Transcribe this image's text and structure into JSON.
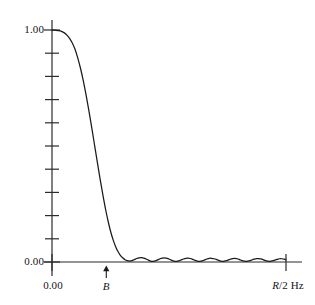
{
  "figure": {
    "name": "filter-frequency-response",
    "background_color": "#ffffff",
    "line_color": "#1a1a1a",
    "axis_color": "#2b2b2b"
  },
  "labels": {
    "y_top": "1.00",
    "y_bottom": "0.00",
    "x_origin": "0.00",
    "x_marker": "B",
    "x_right_italic": "R",
    "x_right_rest": "/2 Hz",
    "x_right_full": "R/2 Hz",
    "arrow_icon": "up-arrow-icon"
  },
  "chart_data": {
    "type": "line",
    "title": "",
    "xlabel": "R/2 Hz",
    "ylabel": "",
    "xlim": [
      0,
      1
    ],
    "ylim": [
      0,
      1.0
    ],
    "grid": false,
    "legend": null,
    "x_ticks": [
      {
        "value": 0,
        "label": "0.00"
      },
      {
        "value": 0.232,
        "label": "B"
      },
      {
        "value": 1.0,
        "label": "R/2 Hz"
      }
    ],
    "y_ticks": [
      {
        "value": 1.0,
        "label": "1.00"
      },
      {
        "value": 0.9,
        "label": ""
      },
      {
        "value": 0.8,
        "label": ""
      },
      {
        "value": 0.7,
        "label": ""
      },
      {
        "value": 0.6,
        "label": ""
      },
      {
        "value": 0.5,
        "label": ""
      },
      {
        "value": 0.4,
        "label": ""
      },
      {
        "value": 0.3,
        "label": ""
      },
      {
        "value": 0.2,
        "label": ""
      },
      {
        "value": 0.1,
        "label": ""
      },
      {
        "value": 0.0,
        "label": "0.00"
      }
    ],
    "annotations": [
      {
        "type": "arrow",
        "x": 0.232,
        "y": 0,
        "label": "B",
        "direction": "up"
      }
    ],
    "series": [
      {
        "name": "magnitude response",
        "x": [
          0.0,
          0.015,
          0.03,
          0.045,
          0.06,
          0.072,
          0.085,
          0.098,
          0.11,
          0.122,
          0.134,
          0.146,
          0.158,
          0.17,
          0.182,
          0.194,
          0.206,
          0.218,
          0.23,
          0.242,
          0.252,
          0.262,
          0.272,
          0.282,
          0.292,
          0.302,
          0.312,
          0.322,
          0.332,
          0.342,
          0.352,
          0.362,
          0.372,
          0.382,
          0.392,
          0.402,
          0.412,
          0.422,
          0.432,
          0.442,
          0.452,
          0.462,
          0.472,
          0.482,
          0.492,
          0.502,
          0.512,
          0.522,
          0.532,
          0.542,
          0.552,
          0.562,
          0.572,
          0.582,
          0.592,
          0.602,
          0.612,
          0.622,
          0.632,
          0.642,
          0.652,
          0.662,
          0.672,
          0.682,
          0.692,
          0.702,
          0.712,
          0.722,
          0.732,
          0.742,
          0.752,
          0.762,
          0.772,
          0.782,
          0.792,
          0.802,
          0.812,
          0.822,
          0.832,
          0.842,
          0.852,
          0.862,
          0.872,
          0.882,
          0.892,
          0.902,
          0.912,
          0.922,
          0.932,
          0.942,
          0.952,
          0.962,
          0.972,
          0.982,
          0.992,
          1.0
        ],
        "y": [
          1.0,
          0.999,
          0.997,
          0.992,
          0.982,
          0.968,
          0.947,
          0.918,
          0.88,
          0.834,
          0.78,
          0.718,
          0.65,
          0.578,
          0.503,
          0.428,
          0.355,
          0.286,
          0.222,
          0.166,
          0.126,
          0.093,
          0.066,
          0.045,
          0.029,
          0.018,
          0.01,
          0.006,
          0.004,
          0.006,
          0.01,
          0.015,
          0.018,
          0.019,
          0.017,
          0.013,
          0.008,
          0.004,
          0.003,
          0.005,
          0.009,
          0.014,
          0.017,
          0.018,
          0.016,
          0.012,
          0.007,
          0.004,
          0.003,
          0.005,
          0.009,
          0.013,
          0.016,
          0.017,
          0.015,
          0.011,
          0.007,
          0.004,
          0.003,
          0.005,
          0.009,
          0.013,
          0.016,
          0.016,
          0.014,
          0.011,
          0.007,
          0.004,
          0.003,
          0.005,
          0.008,
          0.012,
          0.015,
          0.016,
          0.014,
          0.01,
          0.006,
          0.004,
          0.003,
          0.005,
          0.008,
          0.012,
          0.014,
          0.015,
          0.013,
          0.01,
          0.006,
          0.004,
          0.003,
          0.005,
          0.008,
          0.011,
          0.014,
          0.014,
          0.012,
          0.009
        ]
      }
    ]
  }
}
